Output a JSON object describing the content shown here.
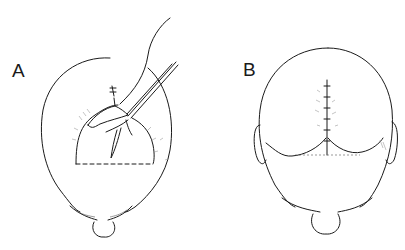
{
  "figure": {
    "panels": [
      {
        "id": "A",
        "label": "A",
        "description": "Top view of scalp with U-shaped flap incision (dashed base line), flap being elevated with forceps and sutured at apex"
      },
      {
        "id": "B",
        "label": "B",
        "description": "Top view of scalp after closure showing vertical sutured incision line meeting a horizontal curved closure line"
      }
    ],
    "colors": {
      "line": "#1a1a1a",
      "background": "#ffffff"
    }
  }
}
